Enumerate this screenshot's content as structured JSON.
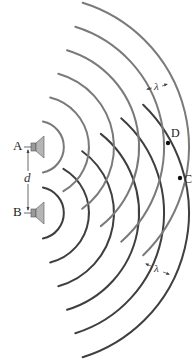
{
  "diagram": {
    "sources": [
      {
        "label": "A",
        "x": 38,
        "y": 147,
        "wave_color": "#7a7a7a"
      },
      {
        "label": "B",
        "x": 38,
        "y": 213,
        "wave_color": "#3f3f3f"
      }
    ],
    "wavelength_px": 25,
    "radii": [
      26,
      51,
      76,
      101,
      126,
      151
    ],
    "separation_label": "d",
    "wavelength_label": "λ",
    "points": [
      {
        "label": "D",
        "x": 168,
        "y": 143
      },
      {
        "label": "C",
        "x": 180,
        "y": 178
      }
    ]
  }
}
